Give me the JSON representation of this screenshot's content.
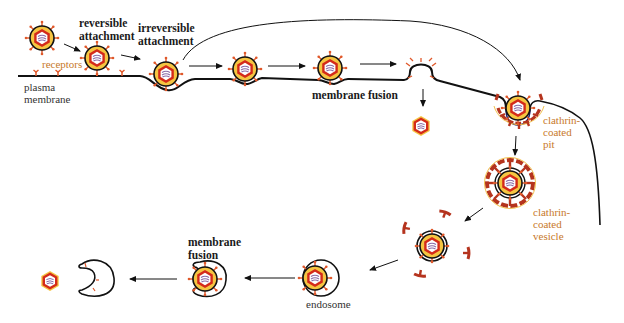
{
  "figure": {
    "type": "virus entry pathways diagram",
    "colors": {
      "membrane": "#111111",
      "capsid_red": "#d42a1a",
      "capsid_outer": "#c0391b",
      "envelope_yellow": "#f5c542",
      "spike_orange": "#e0582a",
      "clathrin_brown": "#b5341e",
      "clathrin_yellow": "#f2c14e",
      "genome_purple": "#8a6aa8",
      "label_orange": "#c8792a",
      "label_dark": "#1a1a1a"
    }
  },
  "labels": {
    "reversible_attachment": "reversible\nattachment",
    "irreversible_attachment": "irreversible\nattachment",
    "receptors": "receptors",
    "plasma_membrane": "plasma\nmembrane",
    "membrane_fusion_top": "membrane fusion",
    "clathrin_coated_pit": "clathrin-\ncoated\npit",
    "clathrin_coated_vesicle": "clathrin-\ncoated\nvesicle",
    "endosome": "endosome",
    "membrane_fusion_bottom": "membrane\nfusion"
  },
  "stages": [
    {
      "id": "free-virion",
      "x": 42,
      "y": 38
    },
    {
      "id": "reversible-attached-virion",
      "x": 97,
      "y": 58
    },
    {
      "id": "irreversible-attached-virion",
      "x": 167,
      "y": 124
    },
    {
      "id": "hemifusion-virion",
      "x": 245,
      "y": 68
    },
    {
      "id": "fusing-virion",
      "x": 330,
      "y": 68
    },
    {
      "id": "released-capsid-top",
      "x": 421,
      "y": 126
    },
    {
      "id": "clathrin-pit-virion",
      "x": 518,
      "y": 109
    },
    {
      "id": "clathrin-vesicle-virion",
      "x": 510,
      "y": 183
    },
    {
      "id": "uncoating-vesicle-virion",
      "x": 432,
      "y": 246
    },
    {
      "id": "endosome-virion",
      "x": 318,
      "y": 278
    },
    {
      "id": "fusing-endosome-virion",
      "x": 206,
      "y": 279
    },
    {
      "id": "released-capsid-bottom",
      "x": 50,
      "y": 281
    }
  ]
}
